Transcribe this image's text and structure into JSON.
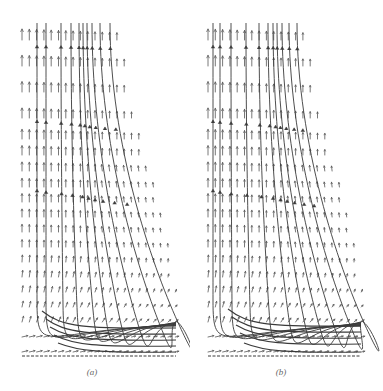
{
  "figure": {
    "arrow_color": "#555555",
    "streamline_color": "#3a3a3a",
    "panels": [
      {
        "id": "a",
        "label": "(a)",
        "offset_x": 0,
        "label_x": 92,
        "label_y": 367,
        "grid_left": 22,
        "grid_col_spacing": 7.3,
        "rows": [
          {
            "y": 40,
            "cols": 14
          },
          {
            "y": 66,
            "cols": 15
          },
          {
            "y": 92,
            "cols": 15
          },
          {
            "y": 118,
            "cols": 16
          },
          {
            "y": 139,
            "cols": 17
          },
          {
            "y": 155,
            "cols": 17
          },
          {
            "y": 171,
            "cols": 18
          },
          {
            "y": 187,
            "cols": 19
          },
          {
            "y": 202,
            "cols": 19
          },
          {
            "y": 217,
            "cols": 20
          },
          {
            "y": 232,
            "cols": 20
          },
          {
            "y": 247,
            "cols": 21
          },
          {
            "y": 262,
            "cols": 21
          },
          {
            "y": 277,
            "cols": 21
          },
          {
            "y": 292,
            "cols": 22
          },
          {
            "y": 307,
            "cols": 22
          },
          {
            "y": 322,
            "cols": 22
          },
          {
            "y": 337,
            "cols": 22
          },
          {
            "y": 352,
            "cols": 22
          }
        ],
        "vertical_streamlines": [
          {
            "x": 37,
            "bend": 0
          },
          {
            "x": 46,
            "bend": 0
          },
          {
            "x": 61,
            "bend": 2
          },
          {
            "x": 71,
            "bend": 6
          },
          {
            "x": 79,
            "bend": 14
          },
          {
            "x": 83,
            "bend": 22
          },
          {
            "x": 87,
            "bend": 32
          },
          {
            "x": 92,
            "bend": 44
          },
          {
            "x": 100,
            "bend": 58
          },
          {
            "x": 110,
            "bend": 68
          }
        ],
        "horizontal_streamlines": [
          {
            "y": 329,
            "x_end": 176
          },
          {
            "y": 335,
            "x_end": 176
          },
          {
            "y": 341,
            "x_end": 176
          },
          {
            "y": 347,
            "x_end": 176
          },
          {
            "y": 353,
            "x_end": 176
          }
        ],
        "top_y": 23,
        "bottom_y": 356,
        "right_edge_bottom": 176
      },
      {
        "id": "b",
        "label": "(b)",
        "offset_x": 189,
        "label_x": 92,
        "label_y": 367,
        "grid_left": 19,
        "grid_col_spacing": 7.3,
        "rows": [
          {
            "y": 40,
            "cols": 14
          },
          {
            "y": 66,
            "cols": 15
          },
          {
            "y": 92,
            "cols": 15
          },
          {
            "y": 118,
            "cols": 16
          },
          {
            "y": 139,
            "cols": 17
          },
          {
            "y": 155,
            "cols": 17
          },
          {
            "y": 171,
            "cols": 18
          },
          {
            "y": 187,
            "cols": 19
          },
          {
            "y": 202,
            "cols": 19
          },
          {
            "y": 217,
            "cols": 20
          },
          {
            "y": 232,
            "cols": 20
          },
          {
            "y": 247,
            "cols": 21
          },
          {
            "y": 262,
            "cols": 21
          },
          {
            "y": 277,
            "cols": 21
          },
          {
            "y": 292,
            "cols": 22
          },
          {
            "y": 307,
            "cols": 22
          },
          {
            "y": 322,
            "cols": 22
          },
          {
            "y": 337,
            "cols": 22
          },
          {
            "y": 352,
            "cols": 22
          }
        ],
        "vertical_streamlines": [
          {
            "x": 24,
            "bend": 0
          },
          {
            "x": 31,
            "bend": 0
          },
          {
            "x": 42,
            "bend": 1
          },
          {
            "x": 57,
            "bend": 4
          },
          {
            "x": 70,
            "bend": 10
          },
          {
            "x": 79,
            "bend": 20
          },
          {
            "x": 84,
            "bend": 30
          },
          {
            "x": 88,
            "bend": 40
          },
          {
            "x": 93,
            "bend": 50
          },
          {
            "x": 100,
            "bend": 60
          },
          {
            "x": 108,
            "bend": 68
          }
        ],
        "horizontal_streamlines": [
          {
            "y": 327,
            "x_end": 172
          },
          {
            "y": 333,
            "x_end": 172
          },
          {
            "y": 339,
            "x_end": 172
          },
          {
            "y": 345,
            "x_end": 172
          },
          {
            "y": 353,
            "x_end": 172
          }
        ],
        "top_y": 23,
        "bottom_y": 356,
        "right_edge_bottom": 172
      }
    ]
  }
}
